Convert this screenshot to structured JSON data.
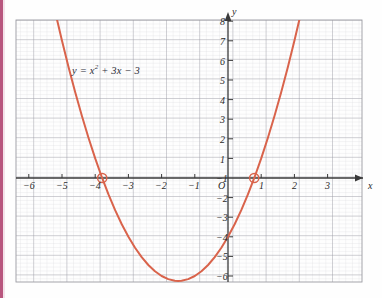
{
  "figure": {
    "equation_label": "y = x² + 3x − 3",
    "equation_parts": {
      "lhs": "y",
      "eq": "=",
      "x": "x",
      "exp": "2",
      "rest": "+ 3x − 3"
    },
    "axis_label_x": "x",
    "axis_label_y": "y",
    "origin_label": "O",
    "footer_text": ""
  },
  "colors": {
    "curve": "#d9634b",
    "axis": "#3a3a3a",
    "major_grid": "#9a9aa2",
    "minor_grid": "#d2d2d8",
    "text": "#2a2a2a",
    "left_strip": "#b8567e",
    "background": "#fefefe"
  },
  "chart_data": {
    "type": "line",
    "title": "",
    "subtitle": "",
    "xlabel": "x",
    "ylabel": "y",
    "equation": "y = x^2 + 3x - 3",
    "grid": true,
    "minor_grid_divisions": 5,
    "legend": "none",
    "xlim": [
      -6.4,
      3.35
    ],
    "ylim": [
      -6.4,
      8.65
    ],
    "xticks": [
      -6,
      -5,
      -4,
      -3,
      -2,
      -1,
      0,
      1,
      2,
      3
    ],
    "yticks": [
      -6,
      -5,
      -4,
      -3,
      -2,
      -1,
      0,
      1,
      2,
      3,
      4,
      5,
      6,
      7,
      8
    ],
    "xtick_labels": [
      "−6",
      "−5",
      "−4",
      "−3",
      "−2",
      "−1",
      "O",
      "1",
      "2",
      "3"
    ],
    "ytick_labels": [
      "−6",
      "−5",
      "−4",
      "−3",
      "−2",
      "−1",
      "",
      "1",
      "2",
      "3",
      "4",
      "5",
      "6",
      "7",
      "8"
    ],
    "series": [
      {
        "name": "y = x² + 3x − 3",
        "color": "#d9634b",
        "x": [
          -5.4,
          -5.2,
          -5.0,
          -4.8,
          -4.6,
          -4.4,
          -4.2,
          -4.0,
          -3.8,
          -3.6,
          -3.4,
          -3.2,
          -3.0,
          -2.8,
          -2.6,
          -2.4,
          -2.2,
          -2.0,
          -1.8,
          -1.6,
          -1.5,
          -1.4,
          -1.2,
          -1.0,
          -0.8,
          -0.6,
          -0.4,
          -0.2,
          0.0,
          0.2,
          0.4,
          0.6,
          0.8,
          1.0,
          1.2,
          1.4,
          1.6,
          1.8,
          2.0,
          2.2,
          2.35
        ],
        "y": [
          9.96,
          8.44,
          7.0,
          5.64,
          4.36,
          3.16,
          2.04,
          1.0,
          0.04,
          -0.84,
          -1.64,
          -2.36,
          -3.0,
          -3.56,
          -4.04,
          -4.44,
          -4.76,
          -5.0,
          -5.16,
          -5.24,
          -5.25,
          -5.24,
          -5.16,
          -5.0,
          -4.76,
          -4.44,
          -4.04,
          -3.56,
          -3.0,
          -2.36,
          -1.64,
          -0.84,
          0.04,
          1.0,
          2.04,
          3.16,
          4.36,
          5.64,
          7.0,
          8.44,
          9.5
        ]
      }
    ],
    "annotations": [
      {
        "type": "label",
        "text": "y = x² + 3x − 3",
        "x": -4.5,
        "y": 5.7
      },
      {
        "type": "open-circle-marker",
        "label": "root",
        "x": -3.79,
        "y": 0
      },
      {
        "type": "open-circle-marker",
        "label": "root",
        "x": 0.79,
        "y": 0
      }
    ],
    "roots": [
      -3.79,
      0.79
    ],
    "vertex": {
      "x": -1.5,
      "y": -5.25
    },
    "y_intercept": -3
  }
}
